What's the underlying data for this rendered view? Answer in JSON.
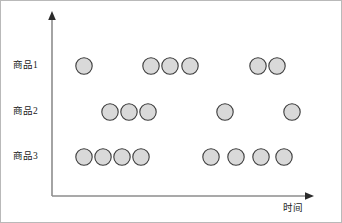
{
  "figure": {
    "width": 342,
    "height": 223,
    "background_color": "#ffffff",
    "frame_color": "#b9b9b9"
  },
  "axes": {
    "y_axis": {
      "name": "y-axis",
      "x": 51,
      "y_top": 12,
      "y_bottom": 195,
      "color": "#8d8d8d",
      "arrow": "up"
    },
    "x_axis": {
      "name": "x-axis",
      "y": 195,
      "x_left": 51,
      "x_right": 312,
      "color": "#8d8d8d",
      "arrow": "right"
    },
    "x_axis_title": "时间",
    "y_axis_title": ""
  },
  "marker": {
    "shape": "circle",
    "radius": 8.2,
    "fill_color": "#d9d9d9",
    "stroke_color": "#3a3a3a"
  },
  "categories": [
    {
      "label": "商品1",
      "y": 65,
      "label_x": 12
    },
    {
      "label": "商品2",
      "y": 111,
      "label_x": 12
    },
    {
      "label": "商品3",
      "y": 156,
      "label_x": 12
    }
  ],
  "chart_data": {
    "type": "scatter",
    "title": "",
    "subtitle": "",
    "xlabel": "时间",
    "ylabel": "",
    "grid": false,
    "legend": null,
    "categories": [
      "商品1",
      "商品2",
      "商品3"
    ],
    "series": [
      {
        "name": "商品1",
        "row": 1,
        "x": [
          83,
          150,
          169,
          189,
          257,
          276
        ],
        "count": 6
      },
      {
        "name": "商品2",
        "row": 2,
        "x": [
          109,
          128,
          147,
          224,
          291
        ],
        "count": 5
      },
      {
        "name": "商品3",
        "row": 3,
        "x": [
          83,
          102,
          121,
          140,
          210,
          235,
          260,
          283
        ],
        "count": 8
      }
    ],
    "xlim": [
      51,
      312
    ],
    "ylim": [
      0,
      3
    ]
  }
}
